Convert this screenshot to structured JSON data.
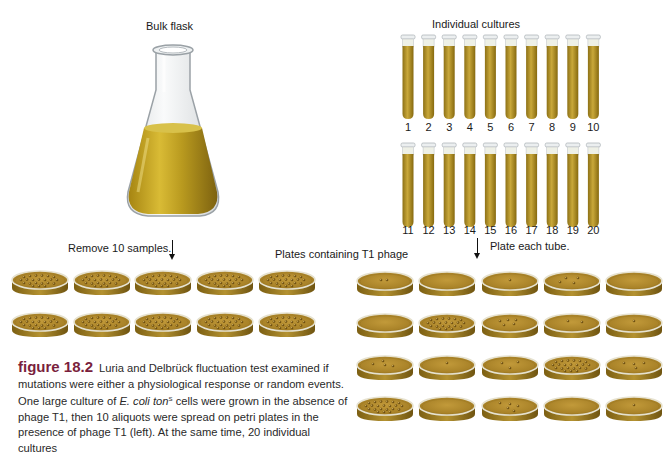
{
  "labels": {
    "bulk_flask": "Bulk flask",
    "individual_cultures": "Individual cultures",
    "remove_samples": "Remove 10 samples.",
    "plates_containing": "Plates containing T1 phage",
    "plate_each_tube": "Plate each tube."
  },
  "tubes": {
    "row1": [
      "1",
      "2",
      "3",
      "4",
      "5",
      "6",
      "7",
      "8",
      "9",
      "10"
    ],
    "row2": [
      "11",
      "12",
      "13",
      "14",
      "15",
      "16",
      "17",
      "18",
      "19",
      "20"
    ]
  },
  "bulk_plates": {
    "rows": 2,
    "cols": 5,
    "colonies_each": "many"
  },
  "individual_plates": {
    "rows": 4,
    "cols": 5,
    "colony_counts": [
      [
        2,
        0,
        1,
        4,
        0
      ],
      [
        0,
        "many",
        5,
        2,
        1
      ],
      [
        4,
        1,
        3,
        "many",
        4
      ],
      [
        "many",
        0,
        5,
        0,
        1
      ]
    ]
  },
  "caption": {
    "figure_label": "figure 18.2",
    "text_1": "Luria and Delbrück fluctuation test examined if mutations were either a physiological response or random events. One large culture of ",
    "species": "E. coli ton",
    "superscript": "S",
    "text_2": " cells were grown in the absence of phage T1, then 10 aliquots were spread on petri plates in the presence of phage T1 (left). At the same time, 20 individual cultures"
  },
  "colors": {
    "medium": "#b08a2a",
    "medium_dark": "#8a6a18",
    "flask_liquid": "#c3a322",
    "glass": "#d9dde0",
    "figure_label": "#7a1f3d"
  }
}
